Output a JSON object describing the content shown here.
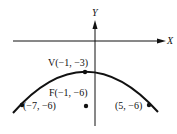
{
  "axes": {
    "x_label": "X",
    "y_label": "Y"
  },
  "points": {
    "vertex": {
      "label": "V(−1, −3)"
    },
    "focus": {
      "label": "F(−1, −6)"
    },
    "left": {
      "label": "(−7, −6)"
    },
    "right": {
      "label": "(5, −6)"
    }
  },
  "colors": {
    "ink": "#111111",
    "background": "#ffffff"
  }
}
